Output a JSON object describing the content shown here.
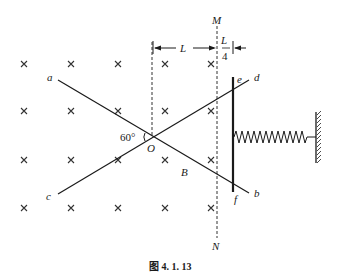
{
  "figure": {
    "caption": "图 4. 1. 13",
    "labels": {
      "M": "M",
      "N": "N",
      "L": "L",
      "L_over_4_num": "L",
      "L_over_4_den": "4",
      "a": "a",
      "b": "b",
      "c": "c",
      "d": "d",
      "e": "e",
      "f": "f",
      "O": "O",
      "B": "B",
      "angle": "60°"
    },
    "colors": {
      "ink": "#1a1a1a",
      "background": "#ffffff"
    },
    "field_symbol": "cross-into-page",
    "elements": [
      "magnetic field B (into page) shown as crosses",
      "rails a-b and c-d crossing at O with 60° angle",
      "dashed boundary MN",
      "conducting rod ef",
      "spring attached to wall"
    ]
  }
}
